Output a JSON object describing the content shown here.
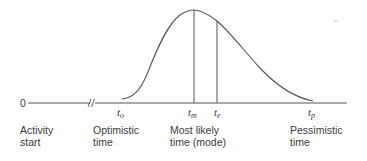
{
  "diagram": {
    "type": "beta-distribution-time-estimate",
    "colors": {
      "line": "#555555",
      "text": "#3a3a3a",
      "background": "#ffffff"
    },
    "axis": {
      "origin_label": "0",
      "has_axis_break": true
    },
    "time_markers": [
      {
        "id": "to",
        "symbol": "t",
        "subscript": "o"
      },
      {
        "id": "tm",
        "symbol": "t",
        "subscript": "m"
      },
      {
        "id": "te",
        "symbol": "t",
        "subscript": "e"
      },
      {
        "id": "tp",
        "symbol": "t",
        "subscript": "p"
      }
    ],
    "captions": {
      "activity_start": {
        "line1": "Activity",
        "line2": "start"
      },
      "optimistic": {
        "line1": "Optimistic",
        "line2": "time"
      },
      "most_likely": {
        "line1": "Most likely",
        "line2": "time (mode)"
      },
      "pessimistic": {
        "line1": "Pessimistic",
        "line2": "time"
      }
    }
  }
}
